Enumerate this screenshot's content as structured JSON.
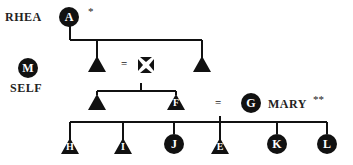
{
  "diagram": {
    "type": "kinship-chart",
    "nodes": {
      "A": {
        "symbol": "circle",
        "letter": "A",
        "label": "RHEA",
        "annotation": "*"
      },
      "M": {
        "symbol": "circle",
        "letter": "M",
        "label": "SELF"
      },
      "G": {
        "symbol": "circle",
        "letter": "G",
        "label": "MARY",
        "annotation": "**"
      },
      "F": {
        "symbol": "triangle",
        "letter": "F"
      },
      "H": {
        "symbol": "triangle",
        "letter": "H"
      },
      "I": {
        "symbol": "triangle",
        "letter": "I"
      },
      "J": {
        "symbol": "circle",
        "letter": "J"
      },
      "E": {
        "symbol": "triangle",
        "letter": "E"
      },
      "K": {
        "symbol": "circle",
        "letter": "K"
      },
      "L": {
        "symbol": "circle",
        "letter": "L"
      }
    },
    "marriage_symbol": "=",
    "colors": {
      "ink": "#111111",
      "background": "#ffffff"
    }
  }
}
